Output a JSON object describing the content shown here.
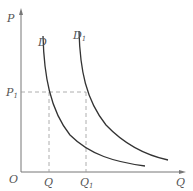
{
  "diagram": {
    "type": "demand-curve-shift",
    "axes": {
      "y_label": "P",
      "x_label": "Q",
      "origin_label": "O"
    },
    "curves": [
      {
        "name": "D",
        "label": "D",
        "subscript": ""
      },
      {
        "name": "D1",
        "label": "D",
        "subscript": "1"
      }
    ],
    "price_level": {
      "label": "P",
      "subscript": "1"
    },
    "quantities": [
      {
        "label": "Q",
        "subscript": ""
      },
      {
        "label": "Q",
        "subscript": "1"
      }
    ],
    "colors": {
      "axis": "#777777",
      "curve": "#333333",
      "dashed": "#999999",
      "text": "#555555"
    }
  }
}
